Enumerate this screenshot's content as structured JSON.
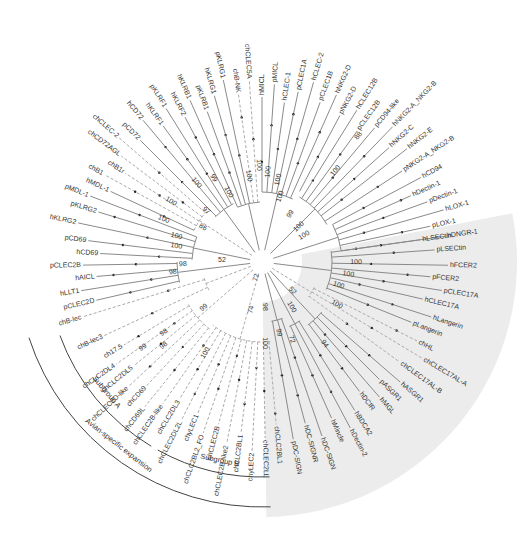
{
  "figure": {
    "type": "circular-phylogenetic-tree",
    "center": [
      262,
      262
    ],
    "shade_color": "#ececec",
    "branch_color": "#8a8a8a",
    "dashed_branch_color": "#aaaaaa"
  },
  "groups": [
    {
      "name": "subgroup-a",
      "label": "Subgroup A"
    },
    {
      "name": "subgroup-b",
      "label": "Subgroup B"
    },
    {
      "name": "avian-expansion",
      "label": "Avian-specific expansion"
    }
  ],
  "leaves": [
    {
      "label": "hLSECtin",
      "angle": -8,
      "dashed": false
    },
    {
      "label": "pLSECtin",
      "angle": -4,
      "dashed": false
    },
    {
      "label": "hFCER2",
      "angle": 1,
      "dashed": false
    },
    {
      "label": "pFCER2",
      "angle": 5,
      "dashed": false
    },
    {
      "label": "pCLEC17A",
      "angle": 9,
      "dashed": false
    },
    {
      "label": "hCLEC17A",
      "angle": 13,
      "dashed": false
    },
    {
      "label": "hLangerin",
      "angle": 18,
      "dashed": false
    },
    {
      "label": "pLangerin",
      "angle": 22,
      "dashed": false
    },
    {
      "label": "chHL",
      "angle": 27,
      "dashed": true
    },
    {
      "label": "chCLEC17AL-A",
      "angle": 31,
      "dashed": true
    },
    {
      "label": "chCLEC17AL-B",
      "angle": 36,
      "dashed": true
    },
    {
      "label": "hASGR1",
      "angle": 41,
      "dashed": false
    },
    {
      "label": "pASGR1",
      "angle": 45,
      "dashed": false
    },
    {
      "label": "hMGL",
      "angle": 49,
      "dashed": false
    },
    {
      "label": "hDCIR",
      "angle": 53,
      "dashed": false
    },
    {
      "label": "hBDCA2",
      "angle": 58,
      "dashed": false
    },
    {
      "label": "hDectin-2",
      "angle": 62,
      "dashed": false
    },
    {
      "label": "hMincle",
      "angle": 66,
      "dashed": false
    },
    {
      "label": "hDC-SIGN",
      "angle": 71,
      "dashed": false
    },
    {
      "label": "hDC-SIGNR",
      "angle": 75,
      "dashed": false
    },
    {
      "label": "pDC-SIGN",
      "angle": 80,
      "dashed": false
    },
    {
      "label": "chCLC2BL1",
      "angle": 85,
      "dashed": true
    },
    {
      "label": "chCLEC2LL",
      "angle": 89,
      "dashed": true
    },
    {
      "label": "chyLEC2",
      "angle": 93,
      "dashed": true
    },
    {
      "label": "chCLC2BL1",
      "angle": 97,
      "dashed": true
    },
    {
      "label": "chCLEC2B-like2",
      "angle": 101,
      "dashed": true
    },
    {
      "label": "chCLEC2B",
      "angle": 105,
      "dashed": true
    },
    {
      "label": "chCLC2BL2_FO",
      "angle": 109,
      "dashed": true
    },
    {
      "label": "chyLEC1",
      "angle": 113,
      "dashed": true
    },
    {
      "label": "chCLEC2DL2L",
      "angle": 117,
      "dashed": true
    },
    {
      "label": "chCLC2DL3",
      "angle": 121,
      "dashed": true
    },
    {
      "label": "chCLEC2B-like",
      "angle": 125,
      "dashed": true
    },
    {
      "label": "chCD69L",
      "angle": 129,
      "dashed": true
    },
    {
      "label": "chCD69",
      "angle": 133,
      "dashed": true
    },
    {
      "label": "chCLEC2D-like",
      "angle": 137,
      "dashed": true
    },
    {
      "label": "chCLC2DL5",
      "angle": 141,
      "dashed": true
    },
    {
      "label": "chCLC2DL4",
      "angle": 145,
      "dashed": true
    },
    {
      "label": "ch17.5",
      "angle": 149,
      "dashed": true
    },
    {
      "label": "chB-lec3",
      "angle": 155,
      "dashed": true
    },
    {
      "label": "chB-lec",
      "angle": 163,
      "dashed": true
    },
    {
      "label": "pCLEC2D",
      "angle": 167,
      "dashed": false
    },
    {
      "label": "hLLT1",
      "angle": 171,
      "dashed": false
    },
    {
      "label": "hAICL",
      "angle": 175,
      "dashed": false
    },
    {
      "label": "pCLEC2B",
      "angle": 179,
      "dashed": false
    },
    {
      "label": "hCD69",
      "angle": 183,
      "dashed": false
    },
    {
      "label": "pCD69",
      "angle": 187,
      "dashed": false
    },
    {
      "label": "hKLRG2",
      "angle": 192,
      "dashed": false
    },
    {
      "label": "pKLRG2",
      "angle": 197,
      "dashed": false
    },
    {
      "label": "pMDL-1",
      "angle": 201,
      "dashed": false
    },
    {
      "label": "hMDL-1",
      "angle": 205,
      "dashed": false
    },
    {
      "label": "chB1",
      "angle": 209,
      "dashed": true
    },
    {
      "label": "chB1r",
      "angle": 213,
      "dashed": true
    },
    {
      "label": "chCD72AGL",
      "angle": 217,
      "dashed": true
    },
    {
      "label": "chCLEC-2",
      "angle": 221,
      "dashed": true
    },
    {
      "label": "pCD72",
      "angle": 225,
      "dashed": false
    },
    {
      "label": "hCD72",
      "angle": 230,
      "dashed": false
    },
    {
      "label": "hKLRF1",
      "angle": 234,
      "dashed": false
    },
    {
      "label": "pKLRF1",
      "angle": 238,
      "dashed": false
    },
    {
      "label": "hKLRF2",
      "angle": 242,
      "dashed": false
    },
    {
      "label": "hKLRB1",
      "angle": 246,
      "dashed": false
    },
    {
      "label": "pKLRB1",
      "angle": 250,
      "dashed": false
    },
    {
      "label": "hKLRG1",
      "angle": 254,
      "dashed": false
    },
    {
      "label": "pKLRG1",
      "angle": 258,
      "dashed": false
    },
    {
      "label": "chB-NK",
      "angle": 262,
      "dashed": true
    },
    {
      "label": "chCLEC5A",
      "angle": 266,
      "dashed": true
    },
    {
      "label": "hMICL",
      "angle": 270,
      "dashed": false
    },
    {
      "label": "pMICL",
      "angle": 274,
      "dashed": false
    },
    {
      "label": "hCLEC-1",
      "angle": 278,
      "dashed": false
    },
    {
      "label": "pCLEC1A",
      "angle": 282,
      "dashed": false
    },
    {
      "label": "hCLEC-2",
      "angle": 286,
      "dashed": false
    },
    {
      "label": "pCLEC1B",
      "angle": 290,
      "dashed": false
    },
    {
      "label": "hNKG2-D",
      "angle": 294,
      "dashed": false
    },
    {
      "label": "pNKG2-D",
      "angle": 298,
      "dashed": false
    },
    {
      "label": "hCLEC12B",
      "angle": 302,
      "dashed": false
    },
    {
      "label": "pCLEC12B",
      "angle": 306,
      "dashed": false
    },
    {
      "label": "pCD94-like",
      "angle": 310,
      "dashed": false
    },
    {
      "label": "hNKG2-A_NKG2-B",
      "angle": 314,
      "dashed": false
    },
    {
      "label": "hNKG2-C",
      "angle": 318,
      "dashed": false
    },
    {
      "label": "hNKG2-E",
      "angle": 322,
      "dashed": false
    },
    {
      "label": "pNKG2-A_NKG2-B",
      "angle": 327,
      "dashed": false
    },
    {
      "label": "hCD94",
      "angle": 332,
      "dashed": false
    },
    {
      "label": "hDectin-1",
      "angle": 336,
      "dashed": false
    },
    {
      "label": "pDectin-1",
      "angle": 340,
      "dashed": false
    },
    {
      "label": "hLOX-1",
      "angle": 344,
      "dashed": false
    },
    {
      "label": "pLOX-1",
      "angle": 348,
      "dashed": false
    },
    {
      "label": "hDNGR-1",
      "angle": 352,
      "dashed": false
    }
  ],
  "bootstrap": [
    {
      "value": "100",
      "x": 356,
      "y": 264
    },
    {
      "value": "100",
      "x": 348,
      "y": 276
    },
    {
      "value": "100",
      "x": 338,
      "y": 287
    },
    {
      "value": "100",
      "x": 336,
      "y": 306
    },
    {
      "value": "52",
      "x": 291,
      "y": 292
    },
    {
      "value": "100",
      "x": 290,
      "y": 308
    },
    {
      "value": "94",
      "x": 323,
      "y": 345
    },
    {
      "value": "72",
      "x": 290,
      "y": 340
    },
    {
      "value": "99",
      "x": 277,
      "y": 333
    },
    {
      "value": "100",
      "x": 263,
      "y": 343
    },
    {
      "value": "98",
      "x": 263,
      "y": 307
    },
    {
      "value": "74",
      "x": 253,
      "y": 310
    },
    {
      "value": "72",
      "x": 258,
      "y": 278
    },
    {
      "value": "100",
      "x": 207,
      "y": 354
    },
    {
      "value": "99",
      "x": 205,
      "y": 309
    },
    {
      "value": "98",
      "x": 165,
      "y": 334
    },
    {
      "value": "99",
      "x": 144,
      "y": 349
    },
    {
      "value": "98",
      "x": 165,
      "y": 347
    },
    {
      "value": "52",
      "x": 222,
      "y": 262
    },
    {
      "value": "98",
      "x": 183,
      "y": 266
    },
    {
      "value": "98",
      "x": 173,
      "y": 274
    },
    {
      "value": "100",
      "x": 176,
      "y": 248
    },
    {
      "value": "100",
      "x": 176,
      "y": 238
    },
    {
      "value": "100",
      "x": 163,
      "y": 221
    },
    {
      "value": "86",
      "x": 202,
      "y": 229
    },
    {
      "value": "100",
      "x": 170,
      "y": 203
    },
    {
      "value": "97",
      "x": 205,
      "y": 212
    },
    {
      "value": "100",
      "x": 195,
      "y": 184
    },
    {
      "value": "99",
      "x": 212,
      "y": 179
    },
    {
      "value": "100",
      "x": 227,
      "y": 193
    },
    {
      "value": "100",
      "x": 247,
      "y": 176
    },
    {
      "value": "100",
      "x": 257,
      "y": 165
    },
    {
      "value": "100",
      "x": 270,
      "y": 172
    },
    {
      "value": "100",
      "x": 280,
      "y": 180
    },
    {
      "value": "100",
      "x": 282,
      "y": 197
    },
    {
      "value": "100",
      "x": 337,
      "y": 172
    },
    {
      "value": "88",
      "x": 360,
      "y": 137
    },
    {
      "value": "99",
      "x": 292,
      "y": 215
    },
    {
      "value": "100",
      "x": 300,
      "y": 228
    },
    {
      "value": "100",
      "x": 305,
      "y": 237
    }
  ]
}
